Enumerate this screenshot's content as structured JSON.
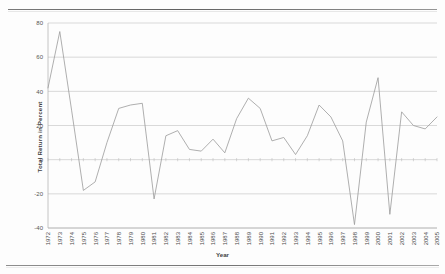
{
  "chart_data": {
    "type": "line",
    "title": "",
    "xlabel": "Year",
    "ylabel": "Total Return in Percent",
    "ylim": [
      -40,
      80
    ],
    "yticks": [
      -40,
      -20,
      0,
      20,
      40,
      60,
      80
    ],
    "ytick_labels": [
      "-40",
      "-20",
      "0",
      "20",
      "40",
      "60",
      "80"
    ],
    "grid": true,
    "legend": "none",
    "categories": [
      "1972",
      "1973",
      "1974",
      "1975",
      "1976",
      "1977",
      "1978",
      "1979",
      "1980",
      "1981",
      "1982",
      "1983",
      "1984",
      "1985",
      "1986",
      "1987",
      "1988",
      "1989",
      "1990",
      "1991",
      "1992",
      "1993",
      "1994",
      "1995",
      "1996",
      "1997",
      "1998",
      "1999",
      "2000",
      "2001",
      "2002",
      "2003",
      "2004",
      "2005"
    ],
    "series": [
      {
        "name": "Total Return",
        "values": [
          42,
          75,
          29,
          -18,
          -13,
          10,
          30,
          32,
          33,
          -23,
          14,
          17,
          6,
          5,
          12,
          4,
          24,
          36,
          30,
          11,
          13,
          3,
          14,
          32,
          25,
          11,
          -38,
          22,
          48,
          -32,
          28,
          20,
          18,
          25
        ]
      }
    ]
  },
  "axis": {
    "y_title": "Total Return in Percent",
    "x_title": "Year"
  }
}
